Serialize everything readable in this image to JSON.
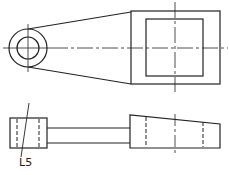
{
  "drawing": {
    "type": "engineering orthographic drawing",
    "views": [
      "top-view",
      "front-view"
    ],
    "stroke_color": "#222222",
    "background": "#ffffff",
    "annotations": [
      {
        "id": "leader-label",
        "text": "L5"
      }
    ]
  }
}
